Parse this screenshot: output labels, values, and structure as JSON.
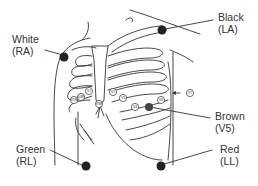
{
  "diagram": {
    "type": "ECG electrode placement on chest",
    "limb_leads": [
      {
        "color_name": "White",
        "position": "RA",
        "dot_color": "#222222"
      },
      {
        "color_name": "Black",
        "position": "LA",
        "dot_color": "#222222"
      },
      {
        "color_name": "Green",
        "position": "RL",
        "dot_color": "#222222"
      },
      {
        "color_name": "Red",
        "position": "LL",
        "dot_color": "#222222"
      }
    ],
    "chest_leads": [
      {
        "color_name": "Brown",
        "position": "V5",
        "dot_color": "#444444"
      }
    ],
    "electrode_labels": [
      "V6R",
      "V5R",
      "V4R",
      "V3R",
      "V1",
      "V2",
      "V3",
      "V4",
      "V6",
      "V7"
    ]
  },
  "labels": {
    "white": {
      "line1": "White",
      "line2": "(RA)"
    },
    "black": {
      "line1": "Black",
      "line2": "(LA)"
    },
    "brown": {
      "line1": "Brown",
      "line2": "(V5)"
    },
    "green": {
      "line1": "Green",
      "line2": "(RL)"
    },
    "red": {
      "line1": "Red",
      "line2": "(LL)"
    }
  },
  "electrodes": {
    "v3r": "V3R",
    "v4r": "V4R",
    "v5r": "V5R",
    "v1": "V1",
    "v2": "V2",
    "v3": "V3",
    "v4": "V4",
    "v6": "V6",
    "v7": "V7"
  }
}
